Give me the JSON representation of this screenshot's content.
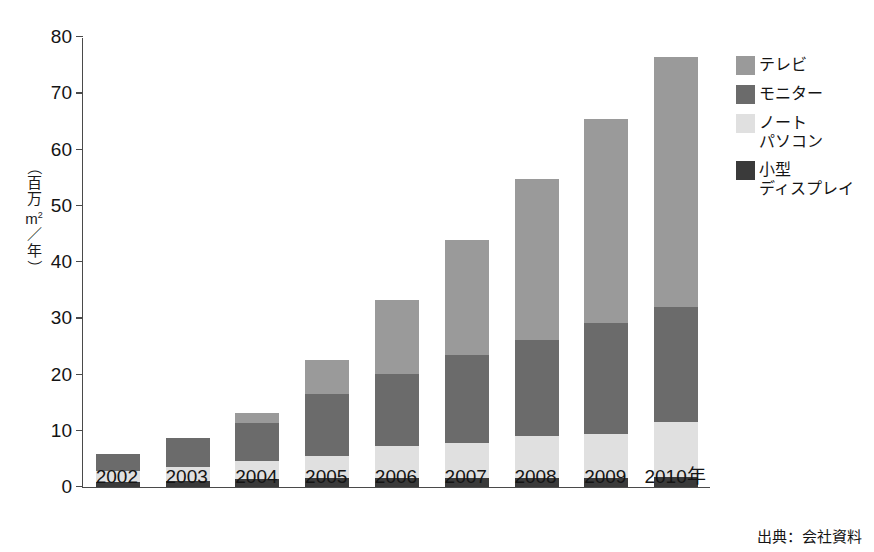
{
  "caption_strip": {
    "text": "────  ──  ── ───────  ── ───── ─── ──── ── ──── ───  ──  ──"
  },
  "chart_data": {
    "type": "bar",
    "subtype": "stacked-column",
    "title": "",
    "xlabel": "",
    "ylabel": "（百万m²／年）",
    "ylim": [
      0,
      80
    ],
    "yticks": [
      0,
      10,
      20,
      30,
      40,
      50,
      60,
      70,
      80
    ],
    "ytick_labels": [
      "0",
      "10",
      "20",
      "30",
      "40",
      "50",
      "60",
      "70",
      "80"
    ],
    "grid": false,
    "legend_position": "right",
    "categories": [
      "2002",
      "2003",
      "2004",
      "2005",
      "2006",
      "2007",
      "2008",
      "2009",
      "2010年"
    ],
    "series": [
      {
        "name": "小型ディスプレイ",
        "key": "small",
        "color": "#3a3a3a",
        "values": [
          0.9,
          1.1,
          1.5,
          1.6,
          1.6,
          1.6,
          1.6,
          1.6,
          1.7
        ]
      },
      {
        "name": "ノートパソコン",
        "key": "notebook",
        "color": "#e0e0e0",
        "values": [
          1.9,
          2.5,
          3.2,
          4.0,
          5.7,
          6.2,
          7.4,
          7.8,
          9.8
        ]
      },
      {
        "name": "モニター",
        "key": "monitor",
        "color": "#6b6b6b",
        "values": [
          3.1,
          5.1,
          6.7,
          11.0,
          12.8,
          15.7,
          17.2,
          19.8,
          20.5
        ]
      },
      {
        "name": "テレビ",
        "key": "tv",
        "color": "#9a9a9a",
        "values": [
          0.0,
          0.0,
          1.7,
          5.9,
          13.1,
          20.5,
          28.6,
          36.3,
          44.5
        ]
      }
    ],
    "totals": [
      5.9,
      8.7,
      13.1,
      22.5,
      33.2,
      44.0,
      54.8,
      65.5,
      76.5
    ]
  },
  "legend": {
    "items": [
      {
        "label": "テレビ",
        "color": "#9a9a9a",
        "key": "tv"
      },
      {
        "label": "モニター",
        "color": "#6b6b6b",
        "key": "monitor"
      },
      {
        "label": "ノート\nパソコン",
        "color": "#e0e0e0",
        "key": "notebook"
      },
      {
        "label": "小型\nディスプレイ",
        "color": "#3a3a3a",
        "key": "small"
      }
    ]
  },
  "axis_title": {
    "open_paren": "（",
    "ch1": "百",
    "ch2": "万",
    "ch3": "m",
    "sup": "2",
    "ch4": "／",
    "ch5": "年",
    "close_paren": "）"
  },
  "source_note": {
    "text": "出典：会社資料"
  }
}
